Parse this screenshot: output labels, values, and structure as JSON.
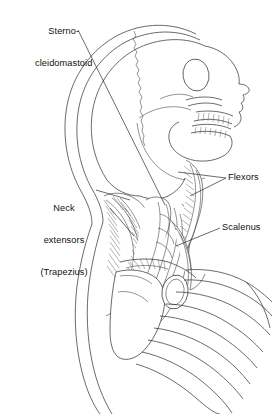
{
  "figure": {
    "view": "lateral",
    "style": "black-and-white anatomical line drawing",
    "background_color": "#ffffff",
    "line_color": "#2b2b2b",
    "text_color": "#101010"
  },
  "labels": {
    "sternocleidomastoid": {
      "line1": "Sterno-",
      "line2": "cleidomastoid",
      "position": "top-left",
      "leader": "diagonal line descending right to the sternocleidomastoid muscle"
    },
    "neck_extensors": {
      "line1": "Neck",
      "line2": "extensors",
      "line3": "(Trapezius)",
      "position": "left",
      "leader": "short line to posterior neck muscles"
    },
    "flexors": {
      "text": "Flexors",
      "position": "right",
      "leader": "line to anterior cervical flexor muscles"
    },
    "scalenus": {
      "text": "Scalenus",
      "position": "right-lower",
      "leader": "line to scalene muscle group"
    }
  },
  "anatomy": {
    "structures": [
      "cranium",
      "scalp outline",
      "coronal suture",
      "orbit",
      "zygomatic arch",
      "nasal bone",
      "maxillary teeth",
      "mandibular teeth",
      "mandible",
      "cervical vertebrae",
      "sternocleidomastoid",
      "trapezius",
      "scalene muscles",
      "cervical flexors",
      "clavicle",
      "scapula",
      "humeral head",
      "ribcage"
    ],
    "rib_count": 9
  }
}
